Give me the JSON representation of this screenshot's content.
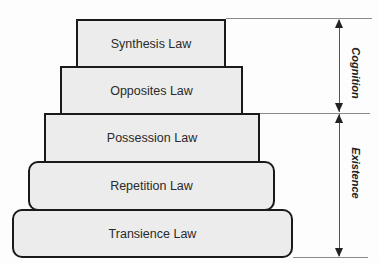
{
  "diagram": {
    "tiers": [
      {
        "label": "Synthesis Law",
        "shape": "rectangle"
      },
      {
        "label": "Opposites Law",
        "shape": "rectangle"
      },
      {
        "label": "Possession Law",
        "shape": "rectangle"
      },
      {
        "label": "Repetition Law",
        "shape": "rounded-rectangle"
      },
      {
        "label": "Transience Law",
        "shape": "rounded-rectangle"
      }
    ],
    "groups": [
      {
        "label": "Cognition",
        "spans": [
          "Synthesis Law",
          "Opposites Law"
        ]
      },
      {
        "label": "Existence",
        "spans": [
          "Possession Law",
          "Repetition Law",
          "Transience Law"
        ]
      }
    ],
    "colors": {
      "tier_fill": "#ececec",
      "tier_border": "#1a1a1a",
      "guide_line": "#8a8a8a"
    }
  }
}
